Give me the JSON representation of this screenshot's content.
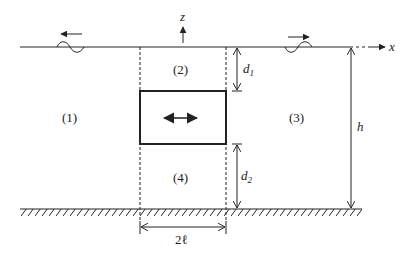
{
  "diagram": {
    "type": "wave-structure-interaction schematic",
    "regions": [
      {
        "id": "region-1",
        "label": "(1)"
      },
      {
        "id": "region-2",
        "label": "(2)"
      },
      {
        "id": "region-3",
        "label": "(3)"
      },
      {
        "id": "region-4",
        "label": "(4)"
      }
    ],
    "axes": {
      "x_label": "x",
      "z_label": "z"
    },
    "dimensions": {
      "d1": {
        "main": "d",
        "sub": "1"
      },
      "d2": {
        "main": "d",
        "sub": "2"
      },
      "h": "h",
      "width": "2ℓ"
    },
    "waves": {
      "left": "incident/reflected wave travelling left",
      "right": "transmitted wave travelling right"
    },
    "structure": "rectangular submerged body with horizontal oscillation arrow",
    "colors": {
      "line": "#222222",
      "background": "#ffffff"
    }
  }
}
